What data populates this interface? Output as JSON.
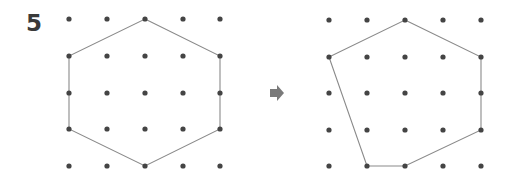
{
  "problem": {
    "number": "5"
  },
  "colors": {
    "dot": "#444444",
    "line": "#8a8a8a",
    "arrow": "#7a7a7a",
    "number": "#3a3a3a"
  },
  "grids": [
    {
      "name": "before",
      "columns": 5,
      "rows": 5,
      "x": [
        69,
        107,
        145,
        183,
        220
      ],
      "y": [
        19,
        56,
        93,
        129,
        166
      ],
      "polygon_vertices_grid": [
        [
          2,
          0
        ],
        [
          4,
          1
        ],
        [
          4,
          3
        ],
        [
          2,
          4
        ],
        [
          0,
          3
        ],
        [
          0,
          1
        ]
      ],
      "shape": "hexagon"
    },
    {
      "name": "after",
      "columns": 5,
      "rows": 5,
      "x": [
        329,
        367,
        405,
        443,
        481
      ],
      "y": [
        20,
        57,
        93,
        130,
        166
      ],
      "polygon_vertices_grid": [
        [
          2,
          0
        ],
        [
          4,
          1
        ],
        [
          4,
          3
        ],
        [
          2,
          4
        ],
        [
          1,
          4
        ],
        [
          0,
          1
        ]
      ],
      "shape": "hexagon"
    }
  ],
  "arrow": {
    "icon": "right-arrow-icon",
    "direction": "right"
  }
}
